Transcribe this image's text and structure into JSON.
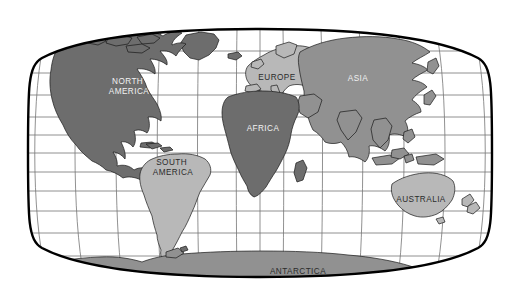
{
  "map": {
    "title": "World Map",
    "projection": "robinson-winkel-tripel",
    "background_color": "#ffffff",
    "ocean_color": "#ffffff",
    "border_color": "#000000",
    "graticule_color": "#6f6f6f",
    "outline_color": "#1a1a1a",
    "frame": {
      "x": 28,
      "y": 28,
      "width": 464,
      "height": 249
    },
    "land_shades": {
      "dark_gray": "#6d6d6d",
      "medium_gray": "#919191",
      "light_gray": "#b8b8b8"
    },
    "graticule": {
      "latitudes": [
        75,
        60,
        45,
        30,
        15,
        0,
        -15,
        -30,
        -45,
        -60,
        -75
      ],
      "longitudes": [
        -180,
        -150,
        -120,
        -90,
        -60,
        -30,
        0,
        30,
        60,
        90,
        120,
        150,
        180
      ],
      "equator_label": "Equator",
      "visible": true
    },
    "continents": [
      {
        "id": "north-america",
        "label": "NORTH AMERICA",
        "label_lines": [
          "NORTH",
          "AMERICA"
        ],
        "shade": "dark_gray",
        "text_color": "light",
        "label_x": 129,
        "label_y": 86
      },
      {
        "id": "south-america",
        "label": "SOUTH AMERICA",
        "label_lines": [
          "SOUTH",
          "AMERICA"
        ],
        "shade": "light_gray",
        "text_color": "dark",
        "label_x": 173,
        "label_y": 167
      },
      {
        "id": "europe",
        "label": "EUROPE",
        "label_lines": [
          "EUROPE"
        ],
        "shade": "light_gray",
        "text_color": "dark",
        "label_x": 277,
        "label_y": 78
      },
      {
        "id": "africa",
        "label": "AFRICA",
        "label_lines": [
          "AFRICA"
        ],
        "shade": "dark_gray",
        "text_color": "light",
        "label_x": 263,
        "label_y": 129
      },
      {
        "id": "asia",
        "label": "ASIA",
        "label_lines": [
          "ASIA"
        ],
        "shade": "medium_gray",
        "text_color": "light",
        "label_x": 358,
        "label_y": 79
      },
      {
        "id": "australia",
        "label": "AUSTRALIA",
        "label_lines": [
          "AUSTRALIA"
        ],
        "shade": "light_gray",
        "text_color": "dark",
        "label_x": 421,
        "label_y": 200
      },
      {
        "id": "antarctica",
        "label": "ANTARCTICA",
        "label_lines": [
          "ANTARCTICA"
        ],
        "shade": "medium_gray",
        "text_color": "dark",
        "label_x": 298,
        "label_y": 272
      }
    ]
  }
}
